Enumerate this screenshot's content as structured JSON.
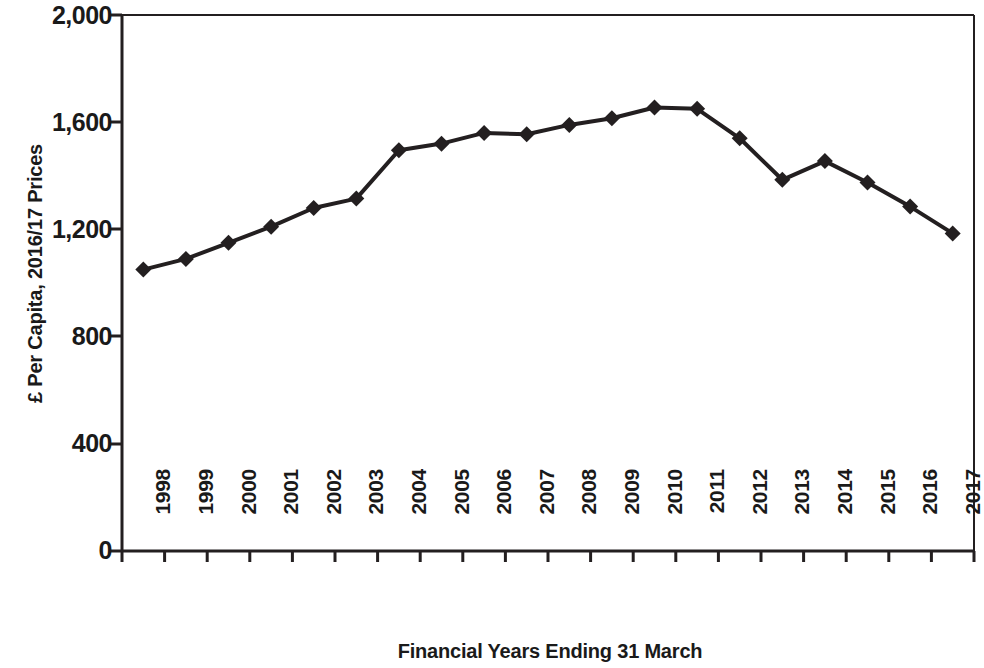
{
  "chart_data": {
    "type": "line",
    "title": "",
    "xlabel": "Financial Years Ending 31 March",
    "ylabel": "£ Per Capita, 2016/17 Prices",
    "categories": [
      "1998",
      "1999",
      "2000",
      "2001",
      "2002",
      "2003",
      "2004",
      "2005",
      "2006",
      "2007",
      "2008",
      "2009",
      "2010",
      "2011",
      "2012",
      "2013",
      "2014",
      "2015",
      "2016",
      "2017"
    ],
    "values": [
      1050,
      1090,
      1150,
      1210,
      1280,
      1315,
      1495,
      1520,
      1560,
      1555,
      1590,
      1615,
      1655,
      1650,
      1540,
      1385,
      1455,
      1375,
      1285,
      1185
    ],
    "series": [
      {
        "name": "£ Per Capita, 2016/17 Prices",
        "values": [
          1050,
          1090,
          1150,
          1210,
          1280,
          1315,
          1495,
          1520,
          1560,
          1555,
          1590,
          1615,
          1655,
          1650,
          1540,
          1385,
          1455,
          1375,
          1285,
          1185
        ]
      }
    ],
    "ylim": [
      0,
      2000
    ],
    "y_ticks": [
      0,
      400,
      800,
      1200,
      1600,
      2000
    ],
    "y_tick_labels": [
      "0",
      "400",
      "800",
      "1,200",
      "1,600",
      "2,000"
    ],
    "grid": false,
    "legend": "none",
    "line_color": "#231f20",
    "marker": "diamond",
    "marker_color": "#231f20",
    "axis_color": "#231f20",
    "background": "#ffffff"
  },
  "axes": {
    "y_title": "£ Per Capita, 2016/17 Prices",
    "x_title": "Financial Years Ending 31 March"
  },
  "y_labels": {
    "t0": "0",
    "t1": "400",
    "t2": "800",
    "t3": "1,200",
    "t4": "1,600",
    "t5": "2,000"
  },
  "x_labels": {
    "y0": "1998",
    "y1": "1999",
    "y2": "2000",
    "y3": "2001",
    "y4": "2002",
    "y5": "2003",
    "y6": "2004",
    "y7": "2005",
    "y8": "2006",
    "y9": "2007",
    "y10": "2008",
    "y11": "2009",
    "y12": "2010",
    "y13": "2011",
    "y14": "2012",
    "y15": "2013",
    "y16": "2014",
    "y17": "2015",
    "y18": "2016",
    "y19": "2017"
  }
}
